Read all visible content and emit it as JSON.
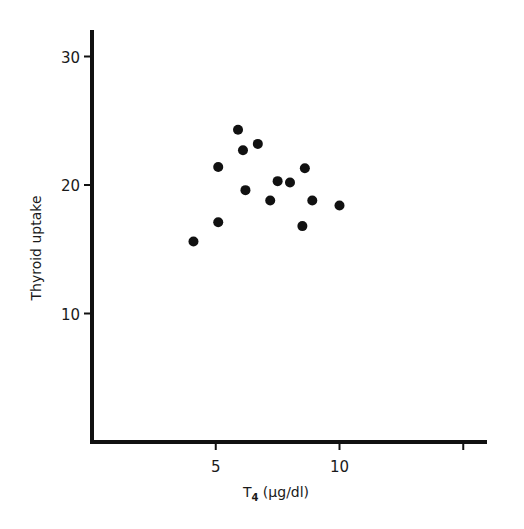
{
  "chart_data": {
    "type": "scatter",
    "title": "",
    "xlabel": "T",
    "xlabel_subscript": "4",
    "xlabel_units": " (μg/dl)",
    "ylabel": "Thyroid uptake",
    "xlim": [
      0,
      16
    ],
    "ylim": [
      0,
      32
    ],
    "x_ticks": [
      5,
      10,
      15
    ],
    "x_tick_labels": [
      "5",
      "10",
      ""
    ],
    "y_ticks": [
      10,
      20,
      30
    ],
    "y_tick_labels": [
      "10",
      "20",
      "30"
    ],
    "grid": false,
    "legend": null,
    "marker_color": "#111111",
    "series": [
      {
        "name": "patients",
        "points": [
          {
            "x": 4.1,
            "y": 15.6
          },
          {
            "x": 5.1,
            "y": 17.1
          },
          {
            "x": 5.1,
            "y": 21.4
          },
          {
            "x": 5.9,
            "y": 24.3
          },
          {
            "x": 6.1,
            "y": 22.7
          },
          {
            "x": 6.2,
            "y": 19.6
          },
          {
            "x": 6.7,
            "y": 23.2
          },
          {
            "x": 7.2,
            "y": 18.8
          },
          {
            "x": 7.5,
            "y": 20.3
          },
          {
            "x": 8.0,
            "y": 20.2
          },
          {
            "x": 8.6,
            "y": 21.3
          },
          {
            "x": 8.5,
            "y": 16.8
          },
          {
            "x": 8.9,
            "y": 18.8
          },
          {
            "x": 10.0,
            "y": 18.4
          }
        ]
      }
    ]
  }
}
